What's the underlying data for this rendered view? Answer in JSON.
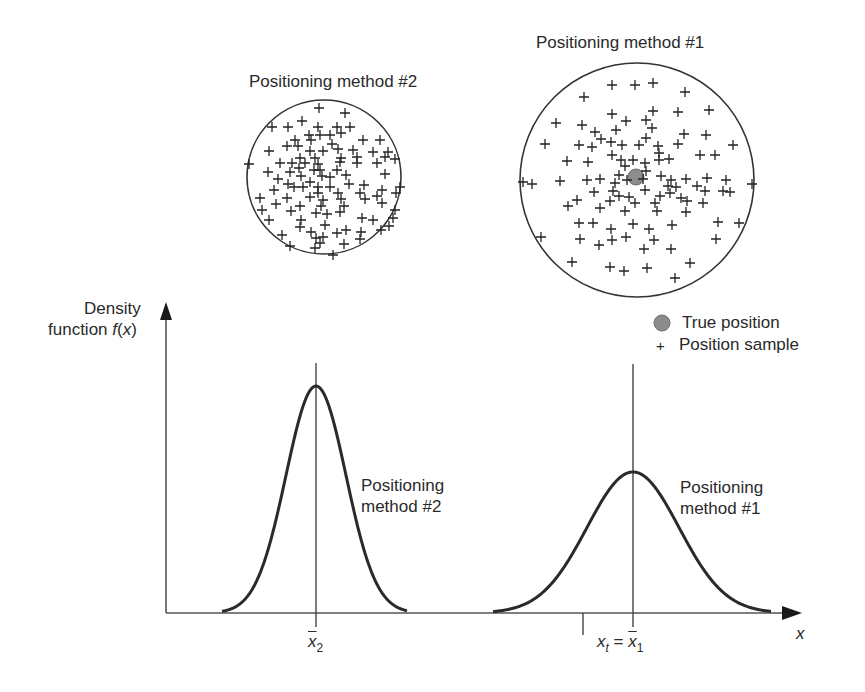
{
  "chart_data": {
    "type": "line",
    "title": "",
    "xlabel": "x",
    "ylabel": "Density function f(x)",
    "grid": false,
    "legend": {
      "position": "upper-right",
      "entries": [
        {
          "marker": "filled-circle",
          "label": "True position",
          "color": "#8a8a8a"
        },
        {
          "marker": "plus",
          "label": "Position sample",
          "color": "#222222"
        }
      ]
    },
    "series": [
      {
        "name": "Positioning method #2",
        "distribution": "normal",
        "mean_label": "x̄2",
        "relative_mean": 0.0,
        "relative_std": 1.0,
        "relative_peak": 1.0
      },
      {
        "name": "Positioning method #1",
        "distribution": "normal",
        "mean_label": "x̄1",
        "relative_mean": 1.0,
        "relative_std": 1.53,
        "relative_peak": 0.62
      }
    ],
    "x_ticks": [
      "x̄2",
      "xt = x̄1"
    ],
    "annotations": [
      "Positioning method #2",
      "Positioning method #1"
    ]
  },
  "scatter_panels": [
    {
      "title": "Positioning method #2",
      "shape": "circle",
      "spread": "tight",
      "true_position_shown": false
    },
    {
      "title": "Positioning method #1",
      "shape": "circle",
      "spread": "wide",
      "true_position_shown": true
    }
  ],
  "labels": {
    "panel2_title": "Positioning method #2",
    "panel1_title": "Positioning method #1",
    "yaxis_line1": "Density",
    "yaxis_line2_prefix": "function ",
    "yaxis_fn": "f",
    "yaxis_paren_open": "(",
    "yaxis_var": "x",
    "yaxis_paren_close": ")",
    "legend_true": "True position",
    "legend_sample": "Position sample",
    "legend_plus": "+",
    "curve2_line1": "Positioning",
    "curve2_line2": "method #2",
    "curve1_line1": "Positioning",
    "curve1_line2": "method #1",
    "xaxis": "x",
    "tick2_var": "x",
    "tick2_sub": "2",
    "tick1_lhs_var": "x",
    "tick1_lhs_sub": "t",
    "tick1_eq": " = ",
    "tick1_rhs_var": "x",
    "tick1_rhs_sub": "1"
  },
  "geometry": {
    "axis_origin": [
      166,
      613
    ],
    "y_arrow_tip": 302,
    "x_arrow_tip": 802,
    "curve2": {
      "mean_x": 316,
      "peak_y": 386,
      "sigma": 30,
      "x_from": 222,
      "x_to": 407,
      "vline_top": 363
    },
    "curve1": {
      "mean_x": 633,
      "peak_y": 472,
      "sigma": 46,
      "x_from": 493,
      "x_to": 771,
      "vline_top": 364
    },
    "xt_tick_x": 583,
    "circle2": {
      "cx": 324,
      "cy": 177,
      "r": 77
    },
    "circle1": {
      "cx": 637,
      "cy": 180,
      "r": 117
    },
    "true_dot": {
      "cx": 636,
      "cy": 177,
      "r": 8,
      "color": "#8c8c8c"
    },
    "legend_dot": {
      "cx": 662,
      "cy": 323,
      "r": 8
    }
  },
  "samples": {
    "circle2": [
      [
        319,
        108
      ],
      [
        345,
        113
      ],
      [
        302,
        121
      ],
      [
        272,
        127
      ],
      [
        288,
        127
      ],
      [
        318,
        127
      ],
      [
        337,
        127
      ],
      [
        350,
        127
      ],
      [
        341,
        133
      ],
      [
        309,
        135
      ],
      [
        320,
        135
      ],
      [
        330,
        135
      ],
      [
        295,
        140
      ],
      [
        311,
        140
      ],
      [
        363,
        140
      ],
      [
        380,
        140
      ],
      [
        287,
        146
      ],
      [
        298,
        146
      ],
      [
        332,
        144
      ],
      [
        269,
        151
      ],
      [
        310,
        151
      ],
      [
        323,
        151
      ],
      [
        338,
        149
      ],
      [
        353,
        150
      ],
      [
        373,
        152
      ],
      [
        300,
        158
      ],
      [
        315,
        158
      ],
      [
        341,
        158
      ],
      [
        357,
        157
      ],
      [
        385,
        157
      ],
      [
        388,
        152
      ],
      [
        395,
        159
      ],
      [
        249,
        164
      ],
      [
        280,
        163
      ],
      [
        292,
        163
      ],
      [
        305,
        163
      ],
      [
        318,
        164
      ],
      [
        340,
        162
      ],
      [
        357,
        163
      ],
      [
        377,
        163
      ],
      [
        299,
        168
      ],
      [
        314,
        170
      ],
      [
        320,
        170
      ],
      [
        337,
        170
      ],
      [
        268,
        172
      ],
      [
        290,
        172
      ],
      [
        301,
        176
      ],
      [
        322,
        176
      ],
      [
        346,
        175
      ],
      [
        385,
        174
      ],
      [
        278,
        179
      ],
      [
        288,
        184
      ],
      [
        310,
        182
      ],
      [
        330,
        177
      ],
      [
        349,
        184
      ],
      [
        364,
        185
      ],
      [
        294,
        187
      ],
      [
        303,
        187
      ],
      [
        318,
        187
      ],
      [
        330,
        187
      ],
      [
        274,
        190
      ],
      [
        318,
        193
      ],
      [
        338,
        193
      ],
      [
        360,
        193
      ],
      [
        365,
        199
      ],
      [
        382,
        190
      ],
      [
        377,
        196
      ],
      [
        396,
        193
      ],
      [
        400,
        187
      ],
      [
        310,
        197
      ],
      [
        323,
        200
      ],
      [
        341,
        199
      ],
      [
        260,
        198
      ],
      [
        287,
        198
      ],
      [
        276,
        204
      ],
      [
        300,
        206
      ],
      [
        321,
        206
      ],
      [
        344,
        206
      ],
      [
        382,
        203
      ],
      [
        395,
        210
      ],
      [
        262,
        210
      ],
      [
        291,
        211
      ],
      [
        269,
        220
      ],
      [
        301,
        220
      ],
      [
        316,
        213
      ],
      [
        327,
        214
      ],
      [
        340,
        212
      ],
      [
        362,
        218
      ],
      [
        373,
        220
      ],
      [
        393,
        218
      ],
      [
        300,
        227
      ],
      [
        325,
        225
      ],
      [
        346,
        230
      ],
      [
        311,
        232
      ],
      [
        337,
        233
      ],
      [
        361,
        232
      ],
      [
        381,
        230
      ],
      [
        389,
        226
      ],
      [
        282,
        235
      ],
      [
        316,
        238
      ],
      [
        323,
        237
      ],
      [
        344,
        244
      ],
      [
        320,
        243
      ],
      [
        360,
        239
      ],
      [
        290,
        246
      ],
      [
        315,
        248
      ],
      [
        333,
        255
      ]
    ],
    "circle1": [
      [
        612,
        85
      ],
      [
        635,
        85
      ],
      [
        653,
        83
      ],
      [
        584,
        97
      ],
      [
        685,
        92
      ],
      [
        612,
        114
      ],
      [
        653,
        111
      ],
      [
        678,
        112
      ],
      [
        709,
        110
      ],
      [
        556,
        123
      ],
      [
        582,
        125
      ],
      [
        626,
        121
      ],
      [
        646,
        120
      ],
      [
        652,
        128
      ],
      [
        595,
        132
      ],
      [
        616,
        130
      ],
      [
        601,
        139
      ],
      [
        684,
        134
      ],
      [
        611,
        142
      ],
      [
        646,
        138
      ],
      [
        706,
        135
      ],
      [
        545,
        144
      ],
      [
        579,
        145
      ],
      [
        592,
        147
      ],
      [
        622,
        145
      ],
      [
        639,
        145
      ],
      [
        658,
        146
      ],
      [
        678,
        144
      ],
      [
        733,
        145
      ],
      [
        659,
        153
      ],
      [
        567,
        161
      ],
      [
        588,
        162
      ],
      [
        612,
        155
      ],
      [
        633,
        160
      ],
      [
        659,
        160
      ],
      [
        700,
        155
      ],
      [
        715,
        155
      ],
      [
        669,
        159
      ],
      [
        621,
        160
      ],
      [
        625,
        166
      ],
      [
        645,
        163
      ],
      [
        560,
        181
      ],
      [
        600,
        179
      ],
      [
        587,
        180
      ],
      [
        619,
        175
      ],
      [
        646,
        171
      ],
      [
        661,
        176
      ],
      [
        671,
        180
      ],
      [
        686,
        179
      ],
      [
        697,
        186
      ],
      [
        707,
        178
      ],
      [
        726,
        180
      ],
      [
        668,
        186
      ],
      [
        676,
        187
      ],
      [
        627,
        180
      ],
      [
        643,
        179
      ],
      [
        645,
        190
      ],
      [
        705,
        191
      ],
      [
        615,
        183
      ],
      [
        532,
        184
      ],
      [
        613,
        191
      ],
      [
        681,
        198
      ],
      [
        670,
        193
      ],
      [
        619,
        196
      ],
      [
        629,
        197
      ],
      [
        660,
        196
      ],
      [
        594,
        192
      ],
      [
        577,
        200
      ],
      [
        610,
        201
      ],
      [
        687,
        201
      ],
      [
        723,
        191
      ],
      [
        730,
        192
      ],
      [
        635,
        203
      ],
      [
        655,
        203
      ],
      [
        657,
        211
      ],
      [
        568,
        206
      ],
      [
        600,
        208
      ],
      [
        625,
        211
      ],
      [
        686,
        212
      ],
      [
        703,
        203
      ],
      [
        579,
        223
      ],
      [
        593,
        223
      ],
      [
        611,
        229
      ],
      [
        633,
        224
      ],
      [
        649,
        229
      ],
      [
        672,
        225
      ],
      [
        718,
        222
      ],
      [
        739,
        223
      ],
      [
        612,
        240
      ],
      [
        626,
        237
      ],
      [
        654,
        240
      ],
      [
        580,
        239
      ],
      [
        599,
        245
      ],
      [
        541,
        237
      ],
      [
        716,
        239
      ],
      [
        644,
        249
      ],
      [
        671,
        249
      ],
      [
        572,
        262
      ],
      [
        610,
        267
      ],
      [
        624,
        271
      ],
      [
        647,
        268
      ],
      [
        690,
        263
      ],
      [
        675,
        278
      ],
      [
        752,
        184
      ],
      [
        523,
        182
      ]
    ]
  }
}
